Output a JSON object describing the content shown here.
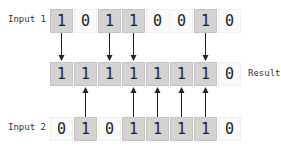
{
  "labels": {
    "input1": "Input 1",
    "input2": "Input 2",
    "result": "Result"
  },
  "rows": {
    "input1": [
      "1",
      "0",
      "1",
      "1",
      "0",
      "0",
      "1",
      "0"
    ],
    "result": [
      "1",
      "1",
      "1",
      "1",
      "1",
      "1",
      "1",
      "0"
    ],
    "input2": [
      "0",
      "1",
      "0",
      "1",
      "1",
      "1",
      "1",
      "0"
    ]
  },
  "colors": {
    "set_bit_fill": "#d3d3d3",
    "clear_bit_fill": "#fafafa",
    "arrow": "#222222"
  }
}
